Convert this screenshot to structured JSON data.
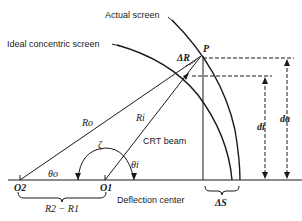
{
  "labels": {
    "actual_screen": "Actual screen",
    "ideal_screen": "Ideal concentric screen",
    "point_p": "P",
    "delta_r": "ΔR",
    "r_o": "Ro",
    "r_i": "Ri",
    "crt_beam": "CRT beam",
    "zeta": "ζ",
    "theta_i": "θi",
    "theta_o": "θo",
    "o2": "O2",
    "o1": "O1",
    "r2_minus_r1": "R2 − R1",
    "deflection_center": "Deflection center",
    "delta_s": "ΔS",
    "d_i": "di",
    "d_a": "da"
  },
  "colors": {
    "ink": "#1a1a1a",
    "background": "#ffffff"
  }
}
